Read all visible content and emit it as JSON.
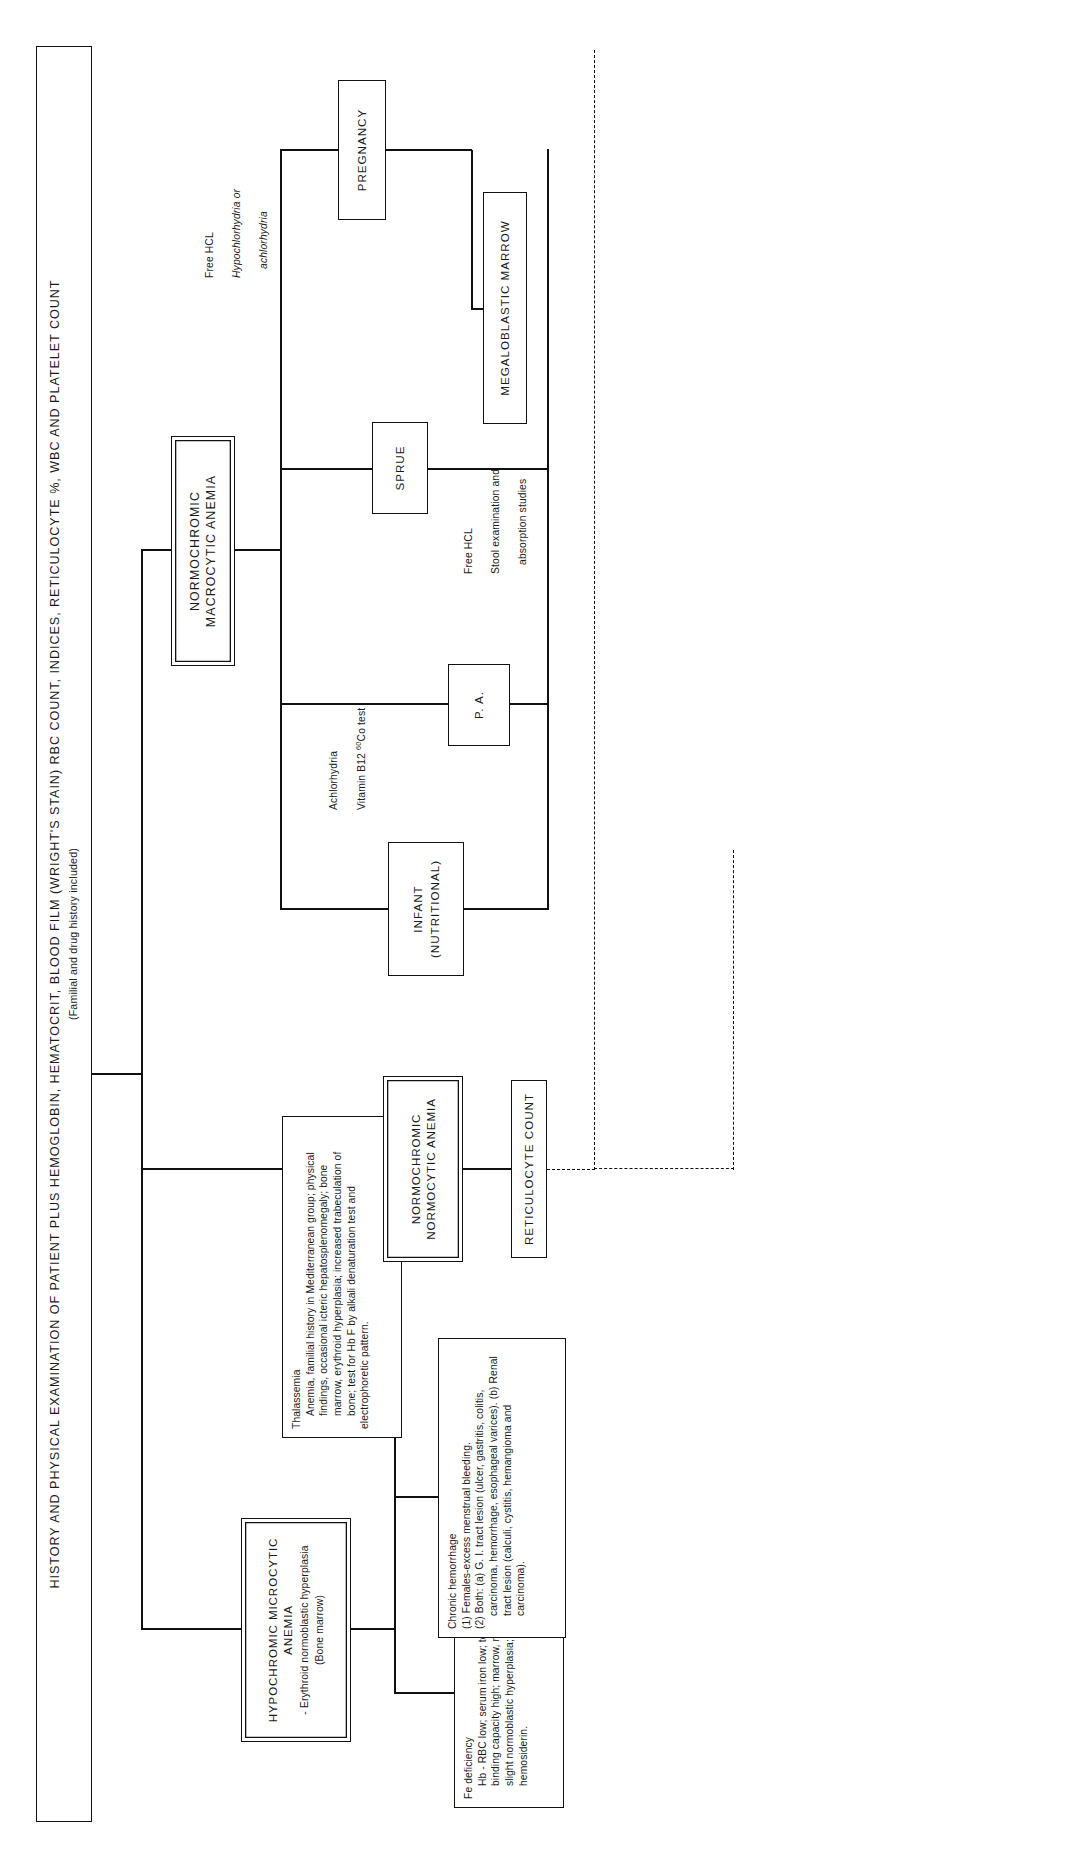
{
  "diagram": {
    "type": "flowchart",
    "orientation": "landscape-rotated-90ccw",
    "title_box": {
      "line1": "HISTORY AND PHYSICAL EXAMINATION OF PATIENT PLUS HEMOGLOBIN, HEMATOCRIT, BLOOD FILM (WRIGHT'S STAIN) RBC COUNT, INDICES, RETICULOCYTE %, WBC AND PLATELET COUNT",
      "line2": "(Familial and drug history included)"
    },
    "categories": [
      {
        "id": "hypochromic",
        "label": "HYPOCHROMIC MICROCYTIC ANEMIA",
        "sub": "- Erythroid normoblastic hyperplasia",
        "sub2": "(Bone marrow)"
      },
      {
        "id": "normocytic",
        "label": "NORMOCHROMIC NORMOCYTIC ANEMIA"
      },
      {
        "id": "macrocytic",
        "label": "NORMOCHROMIC MACROCYTIC ANEMIA"
      }
    ],
    "detail_boxes": [
      {
        "id": "fe-deficiency",
        "title": "Fe deficiency",
        "lines": [
          "Hb - RBC low; serum iron low; total iron-",
          "binding capacity high; marrow, normal to",
          "slight normoblastic hyperplasia; absent",
          "hemosiderin."
        ]
      },
      {
        "id": "thalassemia",
        "title": "Thalassemia",
        "lines": [
          "Anemia, familial history in Mediterranean group; physical",
          "findings, occasional icteric hepatosplenomegaly; bone",
          "marrow, erythroid hyperplasia; increased trabeculation of",
          "bone; test for Hb F by alkali denaturation test and",
          "electrophoretic pattern."
        ]
      },
      {
        "id": "chronic-hemorrhage",
        "title": "Chronic hemorrhage",
        "lines": [
          "(1) Females-excess menstrual bleeding.",
          "(2) Both: (a)  G. I. tract lesion (ulcer, gastritis, colitis,",
          "carcinoma, hemorrhage, esophageal varices).  (b) Renal",
          "tract lesion (calculi, cystitis, hemangioma and",
          "carcinoma)."
        ]
      }
    ],
    "nodes": [
      {
        "id": "reticulocyte-count",
        "label": "RETICULOCYTE COUNT"
      },
      {
        "id": "infant-nutritional",
        "label": "INFANT",
        "label2": "(NUTRITIONAL)"
      },
      {
        "id": "pa",
        "label": "P. A."
      },
      {
        "id": "sprue",
        "label": "SPRUE"
      },
      {
        "id": "pregnancy",
        "label": "PREGNANCY"
      },
      {
        "id": "megaloblastic-marrow",
        "label": "MEGALOBLASTIC MARROW"
      }
    ],
    "edge_labels": [
      {
        "id": "pa-tests",
        "line1": "Achlorhydria",
        "line2": "Vitamin B12  ",
        "sup": "60",
        "tail": "Co  test"
      },
      {
        "id": "sprue-tests",
        "line1": "Free HCL",
        "line2": "Stool examination and",
        "line3": "absorption studies"
      },
      {
        "id": "pregnancy-tests",
        "line1": "Free HCL",
        "line2": "Hypochlorhydria or",
        "line3": "achlorhydria"
      }
    ]
  }
}
